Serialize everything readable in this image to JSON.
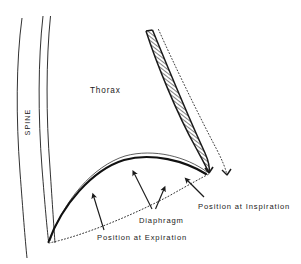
{
  "figure": {
    "kind": "anatomical-line-diagram",
    "background_color": "#ffffff",
    "ink_color": "#1a1a1a"
  },
  "labels": {
    "spine": "SPINE",
    "thorax": "Thorax",
    "diaphragm": "Diaphragm",
    "position_inspiration": "Position at Inspiration",
    "position_expiration": "Position at Expiration"
  },
  "structures": {
    "spine": {
      "name": "spine-outline",
      "stroke": "#1a1a1a",
      "curves": [
        "M 22 18 C 16 62, 16 118, 20 172 C 23 212, 25 238, 27 258",
        "M 43 16 C 38 60, 38 116, 42 168 C 45 206, 47 228, 49 241",
        "M 50 16 C 46 60, 46 116, 50 168 C 52 206, 53 229, 54 242"
      ]
    },
    "rib": {
      "name": "rib-hatched-band",
      "stroke": "#1a1a1a",
      "fill_pattern": "cross-hatch",
      "outer_edge": "M 146 31 C 156 62, 176 112, 196 148 C 202 159, 206 166, 209 172",
      "inner_edge": "M 152 30 C 163 61, 183 111, 202 147 C 207 157, 210 164, 212 171",
      "tip": [
        209,
        174
      ]
    },
    "rib_dotted_outline": {
      "name": "rib-inspiration-dotted",
      "stroke": "#1a1a1a",
      "dash": "1,2",
      "path": "M 158 30 C 172 62, 196 112, 216 150 C 221 160, 224 168, 226 174"
    },
    "diaphragm_expiration": {
      "name": "diaphragm-expiration-curve",
      "stroke": "#111111",
      "stroke_width": 2.0,
      "path": "M 48 241 C 62 205, 92 170, 124 160 C 152 152, 184 160, 205 174"
    },
    "diaphragm_expiration_inner": {
      "name": "diaphragm-expiration-inner-line",
      "stroke": "#1a1a1a",
      "stroke_width": 0.7,
      "path": "M 50 241 C 63 201, 93 166, 125 156 C 154 148, 186 157, 206 172"
    },
    "diaphragm_inspiration": {
      "name": "diaphragm-inspiration-dotted",
      "stroke": "#1a1a1a",
      "dash": "1,2",
      "path": "M 49 243 C 80 236, 130 216, 168 196 C 190 184, 202 177, 209 174"
    }
  },
  "leader_arrows": [
    {
      "name": "arrow-expiration",
      "path": "M 104 228 L 93 195",
      "points_to": "diaphragm-expiration-curve"
    },
    {
      "name": "arrow-diaphragm-upper",
      "path": "M 151 208 L 133 172",
      "points_to": "diaphragm-expiration-curve"
    },
    {
      "name": "arrow-diaphragm-lower",
      "path": "M 155 208 L 163 188",
      "points_to": "diaphragm-inspiration-dotted"
    },
    {
      "name": "arrow-inspiration",
      "path": "M 203 196 L 186 179",
      "points_to": "diaphragm-inspiration-dotted"
    }
  ],
  "label_positions": {
    "spine": {
      "x": 30,
      "y": 120,
      "rotation": -90
    },
    "thorax": {
      "x": 90,
      "y": 90
    },
    "diaphragm": {
      "x": 139,
      "y": 222
    },
    "position_inspiration": {
      "x": 198,
      "y": 208
    },
    "position_expiration": {
      "x": 97,
      "y": 239
    }
  }
}
